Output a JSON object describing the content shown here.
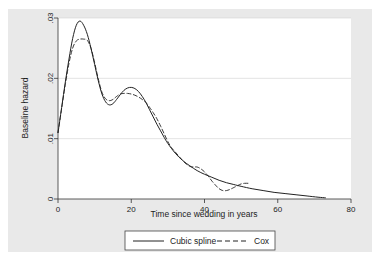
{
  "figure": {
    "background_color": "#ffffff",
    "panel_color": "#e9e9e9",
    "plot_color": "#ffffff",
    "line_color": "#222222",
    "grid_color": "#d8d8d8"
  },
  "chart_data": {
    "type": "line",
    "title": "",
    "xlabel": "Time since wedding in years",
    "ylabel": "Baseline hazard",
    "xlim": [
      0,
      80
    ],
    "ylim": [
      0,
      0.03
    ],
    "xticks": [
      0,
      20,
      40,
      60,
      80
    ],
    "xtick_labels": [
      "0",
      "20",
      "40",
      "60",
      "80"
    ],
    "yticks": [
      0,
      0.01,
      0.02,
      0.03
    ],
    "ytick_labels": [
      "0",
      ".01",
      ".02",
      ".03"
    ],
    "grid": "horizontal",
    "legend_position": "bottom-center",
    "series": [
      {
        "name": "Cubic spline",
        "style": "solid",
        "x": [
          0,
          1,
          2,
          3,
          4,
          5,
          6,
          7,
          8,
          9,
          10,
          11,
          12,
          13,
          14,
          15,
          16,
          17,
          18,
          19,
          20,
          21,
          22,
          23,
          24,
          25,
          26,
          27,
          28,
          29,
          30,
          32,
          34,
          36,
          38,
          40,
          42,
          44,
          46,
          48,
          50,
          53,
          56,
          59,
          62,
          65,
          68,
          71,
          73
        ],
        "y": [
          0.011,
          0.0152,
          0.0194,
          0.0232,
          0.0266,
          0.0288,
          0.0295,
          0.0288,
          0.0273,
          0.025,
          0.0223,
          0.0196,
          0.0174,
          0.0161,
          0.0156,
          0.0158,
          0.0165,
          0.0173,
          0.018,
          0.0184,
          0.0185,
          0.0183,
          0.0178,
          0.017,
          0.016,
          0.0148,
          0.0136,
          0.0124,
          0.0113,
          0.0102,
          0.0092,
          0.0076,
          0.0064,
          0.0055,
          0.0047,
          0.0041,
          0.0036,
          0.0031,
          0.0027,
          0.0024,
          0.0021,
          0.0017,
          0.0014,
          0.0011,
          0.0009,
          0.0007,
          0.0005,
          0.0003,
          0.0002
        ]
      },
      {
        "name": "Cox",
        "style": "dashed",
        "x": [
          0,
          1,
          2,
          3,
          4,
          5,
          6,
          7,
          8,
          9,
          10,
          11,
          12,
          13,
          14,
          15,
          16,
          17,
          18,
          19,
          20,
          21,
          22,
          23,
          24,
          25,
          26,
          27,
          28,
          29,
          30,
          31,
          32,
          33,
          34,
          35,
          36,
          37,
          38,
          39,
          40,
          41,
          42,
          43,
          44,
          45,
          46,
          47,
          48,
          49,
          50,
          51,
          52
        ],
        "y": [
          0.011,
          0.015,
          0.019,
          0.0225,
          0.025,
          0.0262,
          0.0265,
          0.0265,
          0.0263,
          0.025,
          0.0226,
          0.0199,
          0.0177,
          0.0166,
          0.0163,
          0.0165,
          0.017,
          0.0174,
          0.0175,
          0.0175,
          0.0174,
          0.0172,
          0.0169,
          0.0165,
          0.016,
          0.0152,
          0.0143,
          0.0133,
          0.0121,
          0.0108,
          0.0095,
          0.0085,
          0.0078,
          0.0071,
          0.0064,
          0.0058,
          0.0054,
          0.0053,
          0.0053,
          0.005,
          0.0045,
          0.0038,
          0.003,
          0.0023,
          0.0017,
          0.0014,
          0.0014,
          0.0016,
          0.0019,
          0.0022,
          0.0025,
          0.0026,
          0.0026
        ]
      }
    ]
  },
  "legend": {
    "entries": [
      {
        "label": "Cubic spline",
        "style": "solid"
      },
      {
        "label": "Cox",
        "style": "dashed"
      }
    ]
  }
}
